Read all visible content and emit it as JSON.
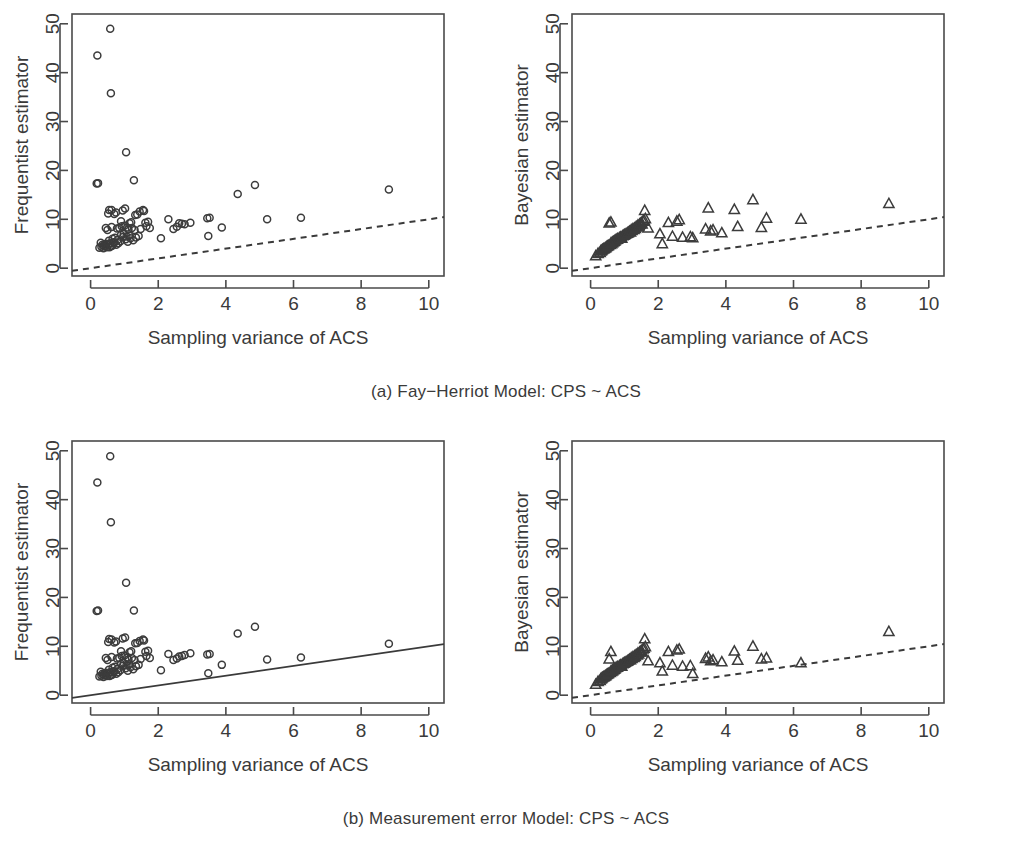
{
  "figure": {
    "background": "#ffffff",
    "foreground": "#3a3a3a",
    "subfigures": [
      {
        "id": "a",
        "caption": "(a) Fay−Herriot Model: CPS ~ ACS"
      },
      {
        "id": "b",
        "caption": "(b) Measurement error Model: CPS ~ ACS"
      }
    ]
  },
  "chart_data": [
    {
      "panel": "a-left",
      "type": "scatter",
      "title": "",
      "xlabel": "Sampling variance of ACS",
      "ylabel": "Frequentist estimator",
      "xlim": [
        -0.55,
        10.45
      ],
      "ylim": [
        -1.6,
        52.0
      ],
      "xticks": [
        0,
        2,
        4,
        6,
        8,
        10
      ],
      "yticks": [
        0,
        10,
        20,
        30,
        40,
        50
      ],
      "xticklabels": [
        "0",
        "2",
        "4",
        "6",
        "8",
        "10"
      ],
      "yticklabels": [
        "0",
        "10",
        "20",
        "30",
        "40",
        "50"
      ],
      "grid": false,
      "legend": "none",
      "marker": "open-circle",
      "annotations": [
        {
          "kind": "reference-line",
          "style": "dashed",
          "x": [
            -0.55,
            10.45
          ],
          "y": [
            -0.55,
            10.45
          ]
        }
      ],
      "x": [
        0.2,
        0.58,
        0.6,
        1.05,
        0.18,
        0.22,
        1.28,
        4.86,
        8.82,
        4.35,
        0.55,
        0.62,
        0.95,
        1.02,
        1.55,
        1.58,
        1.45,
        0.52,
        0.7,
        0.75,
        0.9,
        1.15,
        1.2,
        1.32,
        1.38,
        1.62,
        1.7,
        2.3,
        2.62,
        2.7,
        2.95,
        3.45,
        3.52,
        5.22,
        6.22,
        0.45,
        0.5,
        0.62,
        0.78,
        0.85,
        0.92,
        1.0,
        1.08,
        1.12,
        1.22,
        1.3,
        1.48,
        1.65,
        1.75,
        2.45,
        2.55,
        2.78,
        3.88,
        0.3,
        0.35,
        0.4,
        0.44,
        0.48,
        0.54,
        0.58,
        0.65,
        0.68,
        0.72,
        0.8,
        0.88,
        0.96,
        1.04,
        1.1,
        1.18,
        1.26,
        1.34,
        1.42,
        0.26,
        0.32,
        0.38,
        0.42,
        0.46,
        0.52,
        0.56,
        0.6,
        0.64,
        0.7,
        0.76,
        0.82,
        0.9,
        0.98,
        1.06,
        1.14,
        2.08,
        3.48
      ],
      "y": [
        43.5,
        49.0,
        35.8,
        23.7,
        17.3,
        17.4,
        18.0,
        17.0,
        16.1,
        15.2,
        11.9,
        11.9,
        11.8,
        12.2,
        11.9,
        11.7,
        11.6,
        11.2,
        11.1,
        11.4,
        9.6,
        9.2,
        9.4,
        10.9,
        11.0,
        9.3,
        9.5,
        10.0,
        9.2,
        9.1,
        9.3,
        10.2,
        10.3,
        10.0,
        10.3,
        8.2,
        7.8,
        8.4,
        8.1,
        8.2,
        8.6,
        8.7,
        8.3,
        7.9,
        8.2,
        7.8,
        8.0,
        8.6,
        8.2,
        8.0,
        8.5,
        9.0,
        8.3,
        5.2,
        4.8,
        4.5,
        4.6,
        4.3,
        5.6,
        5.1,
        6.0,
        5.3,
        6.2,
        5.8,
        5.5,
        6.4,
        5.9,
        5.4,
        6.1,
        5.7,
        6.3,
        6.6,
        4.2,
        4.4,
        4.1,
        4.9,
        5.0,
        4.7,
        4.3,
        4.5,
        4.6,
        5.2,
        4.8,
        5.1,
        6.8,
        7.0,
        6.5,
        6.7,
        6.1,
        6.6
      ]
    },
    {
      "panel": "a-right",
      "type": "scatter",
      "title": "",
      "xlabel": "Sampling variance of ACS",
      "ylabel": "Bayesian estimator",
      "xlim": [
        -0.55,
        10.45
      ],
      "ylim": [
        -1.6,
        52.0
      ],
      "xticks": [
        0,
        2,
        4,
        6,
        8,
        10
      ],
      "yticks": [
        0,
        10,
        20,
        30,
        40,
        50
      ],
      "xticklabels": [
        "0",
        "2",
        "4",
        "6",
        "8",
        "10"
      ],
      "yticklabels": [
        "0",
        "10",
        "20",
        "30",
        "40",
        "50"
      ],
      "grid": false,
      "legend": "none",
      "marker": "open-triangle",
      "annotations": [
        {
          "kind": "reference-line",
          "style": "dashed",
          "x": [
            -0.55,
            10.45
          ],
          "y": [
            -0.55,
            10.45
          ]
        }
      ],
      "x": [
        0.15,
        0.22,
        0.3,
        0.35,
        0.4,
        0.45,
        0.5,
        0.55,
        0.58,
        0.62,
        0.65,
        0.7,
        0.75,
        0.8,
        0.85,
        0.9,
        0.95,
        1.0,
        1.05,
        1.1,
        1.15,
        1.2,
        1.25,
        1.3,
        1.35,
        1.4,
        1.45,
        1.5,
        1.55,
        1.6,
        0.28,
        0.33,
        0.38,
        0.43,
        0.48,
        0.53,
        0.6,
        0.68,
        0.72,
        0.78,
        0.88,
        0.98,
        1.08,
        1.18,
        1.28,
        1.38,
        1.48,
        1.58,
        1.62,
        1.7,
        2.05,
        2.12,
        2.3,
        2.42,
        2.55,
        2.62,
        2.72,
        2.95,
        3.02,
        3.4,
        3.48,
        3.55,
        3.62,
        3.88,
        4.25,
        4.35,
        4.8,
        5.05,
        5.2,
        6.22,
        8.82,
        0.6,
        0.64,
        0.92,
        1.02,
        1.12,
        1.22,
        1.32,
        1.42,
        1.52
      ],
      "y": [
        2.5,
        3.0,
        3.5,
        3.8,
        4.0,
        4.2,
        4.5,
        9.2,
        4.8,
        5.0,
        5.2,
        5.5,
        5.8,
        6.0,
        6.2,
        6.4,
        6.6,
        6.8,
        7.0,
        7.2,
        7.5,
        7.8,
        8.0,
        8.2,
        8.5,
        8.8,
        9.0,
        9.3,
        9.6,
        11.8,
        3.2,
        3.6,
        3.9,
        4.1,
        4.4,
        4.6,
        5.1,
        5.4,
        5.6,
        5.9,
        6.3,
        6.7,
        7.1,
        7.4,
        7.9,
        8.4,
        9.1,
        9.8,
        10.1,
        8.2,
        7.0,
        5.0,
        9.3,
        6.5,
        9.6,
        9.9,
        6.3,
        6.4,
        6.2,
        8.0,
        12.3,
        7.6,
        7.8,
        7.2,
        12.0,
        8.5,
        14.0,
        8.3,
        10.2,
        10.0,
        13.2,
        9.4,
        5.3,
        6.1,
        6.9,
        7.3,
        7.7,
        8.1,
        8.6,
        9.0
      ]
    },
    {
      "panel": "b-left",
      "type": "scatter",
      "title": "",
      "xlabel": "Sampling variance of ACS",
      "ylabel": "Frequentist estimator",
      "xlim": [
        -0.55,
        10.45
      ],
      "ylim": [
        -1.6,
        52.0
      ],
      "xticks": [
        0,
        2,
        4,
        6,
        8,
        10
      ],
      "yticks": [
        0,
        10,
        20,
        30,
        40,
        50
      ],
      "xticklabels": [
        "0",
        "2",
        "4",
        "6",
        "8",
        "10"
      ],
      "yticklabels": [
        "0",
        "10",
        "20",
        "30",
        "40",
        "50"
      ],
      "grid": false,
      "legend": "none",
      "marker": "open-circle",
      "annotations": [
        {
          "kind": "reference-line",
          "style": "solid",
          "x": [
            -0.55,
            10.45
          ],
          "y": [
            -0.55,
            10.45
          ]
        }
      ],
      "x": [
        0.2,
        0.58,
        0.6,
        1.05,
        0.18,
        0.22,
        1.28,
        4.86,
        8.82,
        4.35,
        0.55,
        0.62,
        0.95,
        1.02,
        1.55,
        1.58,
        1.45,
        0.52,
        0.7,
        0.75,
        0.9,
        1.15,
        1.2,
        1.32,
        1.38,
        1.62,
        1.7,
        2.3,
        2.62,
        2.7,
        2.95,
        3.45,
        3.52,
        5.22,
        6.22,
        0.45,
        0.5,
        0.62,
        0.78,
        0.85,
        0.92,
        1.0,
        1.08,
        1.12,
        1.22,
        1.3,
        1.48,
        1.65,
        1.75,
        2.45,
        2.55,
        2.78,
        3.88,
        0.3,
        0.35,
        0.4,
        0.44,
        0.48,
        0.54,
        0.58,
        0.65,
        0.68,
        0.72,
        0.8,
        0.88,
        0.96,
        1.04,
        1.1,
        1.18,
        1.26,
        1.34,
        1.42,
        0.26,
        0.32,
        0.38,
        0.42,
        0.46,
        0.52,
        0.56,
        0.6,
        0.64,
        0.7,
        0.76,
        0.82,
        0.9,
        0.98,
        1.06,
        1.14,
        2.08,
        3.48
      ],
      "y": [
        43.5,
        48.9,
        35.4,
        23.0,
        17.2,
        17.3,
        17.3,
        14.0,
        10.5,
        12.6,
        11.5,
        11.4,
        11.6,
        11.8,
        11.4,
        11.2,
        11.1,
        10.9,
        10.8,
        11.0,
        9.0,
        8.8,
        9.0,
        10.6,
        10.7,
        8.9,
        9.1,
        8.4,
        7.9,
        8.0,
        8.6,
        8.3,
        8.4,
        7.3,
        7.7,
        7.6,
        7.2,
        7.8,
        7.5,
        7.6,
        8.0,
        8.1,
        7.7,
        7.3,
        7.6,
        7.2,
        7.4,
        8.0,
        7.6,
        7.2,
        7.5,
        8.2,
        6.2,
        4.8,
        4.4,
        4.1,
        4.2,
        3.9,
        5.2,
        4.7,
        5.6,
        4.9,
        5.8,
        5.4,
        5.1,
        6.0,
        5.5,
        5.0,
        5.7,
        5.3,
        5.9,
        6.2,
        3.8,
        4.0,
        3.7,
        4.5,
        4.6,
        4.3,
        3.9,
        4.1,
        4.2,
        4.8,
        4.4,
        4.7,
        6.4,
        6.6,
        6.1,
        6.3,
        5.1,
        4.5
      ]
    },
    {
      "panel": "b-right",
      "type": "scatter",
      "title": "",
      "xlabel": "Sampling variance of ACS",
      "ylabel": "Bayesian estimator",
      "xlim": [
        -0.55,
        10.45
      ],
      "ylim": [
        -1.6,
        52.0
      ],
      "xticks": [
        0,
        2,
        4,
        6,
        8,
        10
      ],
      "yticks": [
        0,
        10,
        20,
        30,
        40,
        50
      ],
      "xticklabels": [
        "0",
        "2",
        "4",
        "6",
        "8",
        "10"
      ],
      "yticklabels": [
        "0",
        "10",
        "20",
        "30",
        "40",
        "50"
      ],
      "grid": false,
      "legend": "none",
      "marker": "open-triangle",
      "annotations": [
        {
          "kind": "reference-line",
          "style": "dashed",
          "x": [
            -0.55,
            10.45
          ],
          "y": [
            -0.55,
            10.45
          ]
        }
      ],
      "x": [
        0.15,
        0.22,
        0.3,
        0.35,
        0.4,
        0.45,
        0.5,
        0.55,
        0.58,
        0.62,
        0.65,
        0.7,
        0.75,
        0.8,
        0.85,
        0.9,
        0.95,
        1.0,
        1.05,
        1.1,
        1.15,
        1.2,
        1.25,
        1.3,
        1.35,
        1.4,
        1.45,
        1.5,
        1.55,
        1.6,
        0.28,
        0.33,
        0.38,
        0.43,
        0.48,
        0.53,
        0.6,
        0.68,
        0.72,
        0.78,
        0.88,
        0.98,
        1.08,
        1.18,
        1.28,
        1.38,
        1.48,
        1.58,
        1.62,
        1.7,
        2.05,
        2.12,
        2.3,
        2.42,
        2.55,
        2.62,
        2.72,
        2.95,
        3.02,
        3.4,
        3.48,
        3.55,
        3.62,
        3.88,
        4.25,
        4.35,
        4.8,
        5.05,
        5.2,
        6.22,
        8.82,
        0.6,
        0.64,
        0.92,
        1.02,
        1.12,
        1.22,
        1.32,
        1.42,
        1.52
      ],
      "y": [
        2.2,
        2.8,
        3.3,
        3.6,
        3.8,
        4.0,
        4.3,
        7.4,
        4.6,
        4.8,
        5.0,
        5.3,
        5.6,
        5.8,
        6.0,
        6.2,
        6.4,
        6.6,
        6.8,
        7.0,
        7.3,
        7.6,
        7.8,
        8.0,
        8.3,
        8.6,
        8.8,
        9.1,
        9.4,
        11.5,
        3.0,
        3.4,
        3.7,
        3.9,
        4.2,
        4.4,
        4.9,
        5.2,
        5.4,
        5.7,
        6.1,
        6.5,
        6.9,
        7.2,
        7.7,
        8.2,
        8.9,
        9.6,
        9.9,
        7.0,
        6.6,
        4.9,
        8.9,
        6.1,
        9.2,
        9.4,
        5.9,
        6.0,
        4.4,
        7.5,
        7.8,
        7.0,
        7.2,
        6.8,
        9.0,
        7.1,
        10.0,
        7.4,
        7.6,
        6.6,
        13.0,
        8.9,
        5.1,
        5.9,
        6.7,
        7.1,
        7.5,
        7.9,
        8.4,
        8.8
      ]
    }
  ]
}
